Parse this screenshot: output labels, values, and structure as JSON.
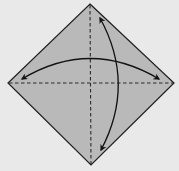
{
  "diagram": {
    "type": "origami-step",
    "colors": {
      "background": "#e9e9e9",
      "paper_fill": "#b9b9b9",
      "outline": "#1e1e1e",
      "crease": "#2a2a2a",
      "arrow": "#111111"
    },
    "paper": {
      "shape": "diamond",
      "vertices": {
        "top": [
          90,
          4
        ],
        "right": [
          174,
          83
        ],
        "bottom": [
          91,
          165
        ],
        "left": [
          8,
          83
        ]
      }
    },
    "creases": [
      {
        "name": "vertical-crease",
        "style": "valley-fold-dashed",
        "from": [
          90,
          4
        ],
        "to": [
          91,
          165
        ]
      },
      {
        "name": "horizontal-crease",
        "style": "valley-fold-dashed",
        "from": [
          8,
          83
        ],
        "to": [
          174,
          83
        ]
      }
    ],
    "arrows": [
      {
        "name": "horizontal-fold-unfold-arrow",
        "kind": "double-headed",
        "from": [
          22,
          78
        ],
        "to": [
          158,
          78
        ]
      },
      {
        "name": "vertical-fold-unfold-arrow",
        "kind": "double-headed",
        "from": [
          100,
          18
        ],
        "to": [
          101,
          150
        ]
      }
    ]
  }
}
